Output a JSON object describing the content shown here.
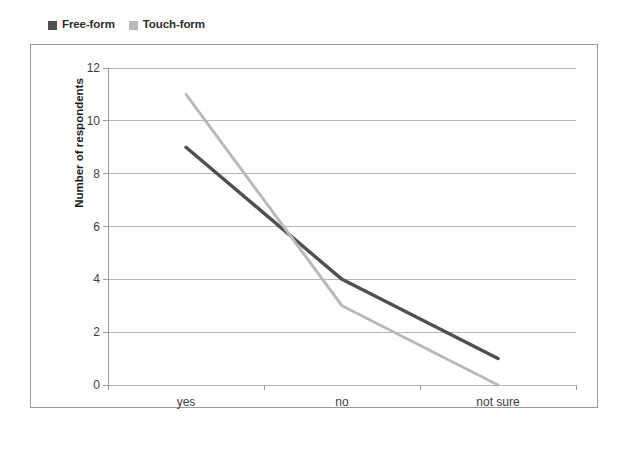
{
  "chart_data": {
    "type": "line",
    "title": "",
    "xlabel": "",
    "ylabel": "Number of respondents",
    "categories": [
      "yes",
      "no",
      "not sure"
    ],
    "series": [
      {
        "name": "Free-form",
        "values": [
          9,
          4,
          1
        ],
        "color": "#4f4f4f"
      },
      {
        "name": "Touch-form",
        "values": [
          11,
          3,
          0
        ],
        "color": "#b9b9b9"
      }
    ],
    "ylim": [
      0,
      12
    ],
    "ytick_labels": [
      "0",
      "2",
      "4",
      "6",
      "8",
      "10",
      "12"
    ],
    "ytick_values": [
      0,
      2,
      4,
      6,
      8,
      10,
      12
    ],
    "ytick_step": 2,
    "grid": "horizontal",
    "legend_position": "top-left",
    "axis_color": "#9a9a9a",
    "grid_color": "#b5b5b5",
    "background": "#ffffff"
  },
  "legend": {
    "entries": [
      {
        "label": "Free-form",
        "swatch_color": "#4f4f4f"
      },
      {
        "label": "Touch-form",
        "swatch_color": "#b9b9b9"
      }
    ]
  }
}
